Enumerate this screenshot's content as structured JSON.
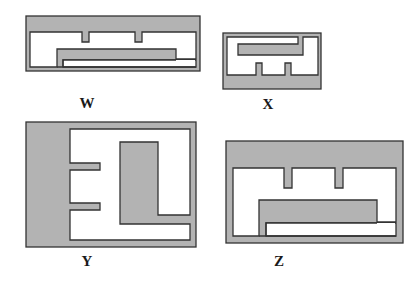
{
  "diagram": {
    "colors": {
      "fill": "#b3b3b3",
      "stroke": "#333333",
      "background": "#ffffff"
    },
    "figures": [
      {
        "id": "W",
        "label": "W"
      },
      {
        "id": "X",
        "label": "X"
      },
      {
        "id": "Y",
        "label": "Y"
      },
      {
        "id": "Z",
        "label": "Z"
      }
    ]
  }
}
